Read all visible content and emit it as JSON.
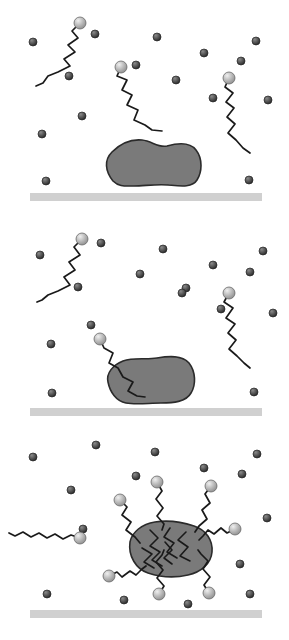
{
  "figure": {
    "type": "scientific-schematic",
    "width": 289,
    "height": 640,
    "background_color": "#ffffff",
    "colors": {
      "protein_fill": "#7a7a7a",
      "protein_stroke": "#2b2b2b",
      "surface_bar": "#d0d0d0",
      "surfactant_tail": "#1a1a1a",
      "surfactant_head_light": "#b8b8b8",
      "surfactant_head_stroke": "#6a6a6a",
      "small_sphere_dark": "#4a4a4a",
      "small_sphere_stroke": "#262626"
    },
    "legend_items": [
      {
        "name": "protein-blob",
        "label": "Protein / soil aggregate",
        "color": "#7a7a7a"
      },
      {
        "name": "surfactant-molecule",
        "label": "Surfactant (head + hydrocarbon tail)",
        "color": "#1a1a1a"
      },
      {
        "name": "small-particle",
        "label": "Solvent / counter-ion particle",
        "color": "#4a4a4a"
      },
      {
        "name": "substrate-surface",
        "label": "Solid substrate surface",
        "color": "#d0d0d0"
      }
    ]
  },
  "panels": [
    {
      "id": "panel-1",
      "index": 1,
      "stage_label": "Adsorbed protein on surface; surfactants dispersed in bulk",
      "y_offset": 0,
      "height": 215,
      "surface": {
        "x": 30,
        "y": 193,
        "width": 232,
        "height": 8
      },
      "protein": {
        "attached": true,
        "path": "M113,181 C105,171 104,160 112,152 C120,144 131,139 142,140 C152,141 158,148 167,146 C178,143 190,142 196,150 C203,159 202,172 197,180 C192,188 180,186 168,185 C156,184 144,186 134,186 C125,186 119,187 113,181 Z"
      },
      "surfactants": [
        {
          "name": "surfactant-upper-left",
          "head": {
            "cx": 80,
            "cy": 23,
            "r": 6
          },
          "tail": "M80,23 L72,31 L78,38 L68,45 L75,52 L64,59 L70,66 L58,72 L48,76 L43,83 L36,86",
          "head_side": "top"
        },
        {
          "name": "surfactant-middle",
          "head": {
            "cx": 121,
            "cy": 67,
            "r": 6
          },
          "tail": "M121,67 L117,76 L127,80 L122,90 L132,95 L127,105 L138,110 L134,120 L145,125 L152,130 L162,131",
          "head_side": "top"
        },
        {
          "name": "surfactant-right",
          "head": {
            "cx": 229,
            "cy": 78,
            "r": 6
          },
          "tail": "M229,78 L225,87 L233,93 L226,102 L234,108 L227,117 L235,124 L228,133 L236,140 L243,148 L250,153",
          "head_side": "top"
        }
      ],
      "particles": [
        {
          "cx": 33,
          "cy": 42,
          "r": 4
        },
        {
          "cx": 95,
          "cy": 34,
          "r": 4
        },
        {
          "cx": 157,
          "cy": 37,
          "r": 4
        },
        {
          "cx": 256,
          "cy": 41,
          "r": 4
        },
        {
          "cx": 204,
          "cy": 53,
          "r": 4
        },
        {
          "cx": 241,
          "cy": 61,
          "r": 4
        },
        {
          "cx": 69,
          "cy": 76,
          "r": 4
        },
        {
          "cx": 136,
          "cy": 65,
          "r": 4
        },
        {
          "cx": 176,
          "cy": 80,
          "r": 4
        },
        {
          "cx": 213,
          "cy": 98,
          "r": 4
        },
        {
          "cx": 268,
          "cy": 100,
          "r": 4
        },
        {
          "cx": 82,
          "cy": 116,
          "r": 4
        },
        {
          "cx": 42,
          "cy": 134,
          "r": 4
        },
        {
          "cx": 46,
          "cy": 181,
          "r": 4
        },
        {
          "cx": 249,
          "cy": 180,
          "r": 4
        }
      ]
    },
    {
      "id": "panel-2",
      "index": 2,
      "stage_label": "Surfactant tail penetrates and begins to solubilise the protein",
      "y_offset": 215,
      "height": 215,
      "surface": {
        "x": 30,
        "y": 193,
        "width": 232,
        "height": 8
      },
      "protein": {
        "attached": true,
        "path": "M108,167 C106,158 113,150 123,146 C134,142 146,145 157,143 C169,141 182,140 189,148 C196,157 196,170 191,178 C186,187 173,188 161,188 C149,188 136,190 126,188 C116,186 110,177 108,167 Z"
      },
      "surfactants": [
        {
          "name": "surfactant-upper-left",
          "head": {
            "cx": 82,
            "cy": 24,
            "r": 6
          },
          "tail": "M82,24 L74,32 L80,40 L69,47 L75,55 L64,62 L70,70 L58,76 L48,80 L42,85 L37,87",
          "head_side": "top"
        },
        {
          "name": "surfactant-right",
          "head": {
            "cx": 229,
            "cy": 78,
            "r": 6
          },
          "tail": "M229,78 L224,87 L233,93 L226,103 L235,109 L228,118 L236,125 L229,134 L237,141 L244,148 L250,153",
          "head_side": "top"
        },
        {
          "name": "surfactant-penetrating",
          "head": {
            "cx": 100,
            "cy": 124,
            "r": 6
          },
          "tail": "M100,124 L104,133 L113,138 L109,148 L118,153 L123,162 L133,167 L128,176 L137,181 L145,182",
          "head_side": "top",
          "penetrates_protein": true
        }
      ],
      "particles": [
        {
          "cx": 40,
          "cy": 40,
          "r": 4
        },
        {
          "cx": 101,
          "cy": 28,
          "r": 4
        },
        {
          "cx": 163,
          "cy": 34,
          "r": 4
        },
        {
          "cx": 263,
          "cy": 36,
          "r": 4
        },
        {
          "cx": 213,
          "cy": 50,
          "r": 4
        },
        {
          "cx": 250,
          "cy": 57,
          "r": 4
        },
        {
          "cx": 140,
          "cy": 59,
          "r": 4
        },
        {
          "cx": 186,
          "cy": 73,
          "r": 4
        },
        {
          "cx": 78,
          "cy": 72,
          "r": 4
        },
        {
          "cx": 182,
          "cy": 78,
          "r": 4
        },
        {
          "cx": 221,
          "cy": 94,
          "r": 4
        },
        {
          "cx": 273,
          "cy": 98,
          "r": 4
        },
        {
          "cx": 91,
          "cy": 110,
          "r": 4
        },
        {
          "cx": 51,
          "cy": 129,
          "r": 4
        },
        {
          "cx": 52,
          "cy": 178,
          "r": 4
        },
        {
          "cx": 254,
          "cy": 177,
          "r": 4
        }
      ]
    },
    {
      "id": "panel-3",
      "index": 3,
      "stage_label": "Protein fully encapsulated by surfactants and released from the surface",
      "y_offset": 430,
      "height": 210,
      "surface": {
        "x": 30,
        "y": 180,
        "width": 232,
        "height": 8
      },
      "protein": {
        "attached": false,
        "path": "M130,112 C132,102 142,94 155,92 C168,90 182,92 194,96 C206,100 213,110 212,122 C211,134 201,142 188,145 C175,148 160,147 148,143 C136,139 128,126 130,112 Z"
      },
      "surfactants": [
        {
          "name": "surfactant-free-left",
          "head": {
            "cx": 80,
            "cy": 108,
            "r": 6
          },
          "tail": "M80,108 L71,105 L63,109 L55,104 L47,108 L39,103 L31,107 L23,102 L15,106 L9,103",
          "head_side": "right",
          "free": true
        },
        {
          "name": "corona-surfactant-top-left",
          "head": {
            "cx": 120,
            "cy": 70,
            "r": 6
          },
          "tail": "M120,70 L127,77 L122,85 L131,92 L126,100 L135,107 L140,113",
          "head_side": "outer"
        },
        {
          "name": "corona-surfactant-top-mid",
          "head": {
            "cx": 157,
            "cy": 52,
            "r": 6
          },
          "tail": "M157,52 L162,61 L156,69 L163,78 L157,86 L164,94 L162,100",
          "head_side": "outer"
        },
        {
          "name": "corona-surfactant-top-right",
          "head": {
            "cx": 211,
            "cy": 56,
            "r": 6
          },
          "tail": "M211,56 L205,64 L210,73 L202,80 L207,89 L199,96 L195,102",
          "head_side": "outer"
        },
        {
          "name": "corona-surfactant-right",
          "head": {
            "cx": 235,
            "cy": 99,
            "r": 6
          },
          "tail": "M235,99 L227,103 L221,98 L214,104 L208,100 L203,106 L199,110",
          "head_side": "outer"
        },
        {
          "name": "corona-surfactant-bottom-right",
          "head": {
            "cx": 209,
            "cy": 163,
            "r": 6
          },
          "tail": "M209,163 L204,155 L210,147 L203,139 L208,131 L201,124 L198,120",
          "head_side": "outer"
        },
        {
          "name": "corona-surfactant-bottom-mid",
          "head": {
            "cx": 159,
            "cy": 164,
            "r": 6
          },
          "tail": "M159,164 L164,156 L157,148 L163,140 L156,132 L162,125 L164,120",
          "head_side": "outer"
        },
        {
          "name": "corona-surfactant-bottom-left",
          "head": {
            "cx": 109,
            "cy": 146,
            "r": 6
          },
          "tail": "M109,146 L117,142 L122,147 L130,141 L136,145 L142,139 L146,136",
          "head_side": "outer"
        }
      ],
      "internal_tails": [
        "M150,100 L158,108 L150,116 L160,122 L152,130 L162,136",
        "M170,98 L164,107 L174,113 L167,122 L177,128",
        "M186,102 L178,110 L188,117 L180,126 L190,131",
        "M142,118 L152,124 L144,132 L154,138",
        "M165,112 L172,120 L164,128 L172,134"
      ],
      "particles": [
        {
          "cx": 33,
          "cy": 27,
          "r": 4
        },
        {
          "cx": 96,
          "cy": 15,
          "r": 4
        },
        {
          "cx": 155,
          "cy": 22,
          "r": 4
        },
        {
          "cx": 204,
          "cy": 38,
          "r": 4
        },
        {
          "cx": 257,
          "cy": 24,
          "r": 4
        },
        {
          "cx": 242,
          "cy": 44,
          "r": 4
        },
        {
          "cx": 71,
          "cy": 60,
          "r": 4
        },
        {
          "cx": 136,
          "cy": 46,
          "r": 4
        },
        {
          "cx": 83,
          "cy": 99,
          "r": 4
        },
        {
          "cx": 267,
          "cy": 88,
          "r": 4
        },
        {
          "cx": 240,
          "cy": 134,
          "r": 4
        },
        {
          "cx": 47,
          "cy": 164,
          "r": 4
        },
        {
          "cx": 124,
          "cy": 170,
          "r": 4
        },
        {
          "cx": 188,
          "cy": 174,
          "r": 4
        },
        {
          "cx": 250,
          "cy": 164,
          "r": 4
        },
        {
          "cx": 108,
          "cy": 146,
          "r": 4
        }
      ]
    }
  ]
}
